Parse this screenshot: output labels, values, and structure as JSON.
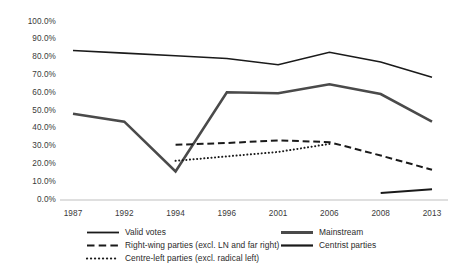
{
  "chart_data": {
    "type": "line",
    "title": "",
    "subtitle": "",
    "xlabel": "",
    "ylabel": "",
    "categories": [
      "1987",
      "1992",
      "1994",
      "1996",
      "2001",
      "2006",
      "2008",
      "2013"
    ],
    "ylim": [
      0,
      100
    ],
    "ytick_labels": [
      "0.0%",
      "10.0%",
      "20.0%",
      "30.0%",
      "40.0%",
      "50.0%",
      "60.0%",
      "70.0%",
      "80.0%",
      "90.0%",
      "100.0%"
    ],
    "ytick_values": [
      0,
      10,
      20,
      30,
      40,
      50,
      60,
      70,
      80,
      90,
      100
    ],
    "grid": false,
    "legend_position": "bottom",
    "series": [
      {
        "name": "Valid votes",
        "style": "solid",
        "color": "#1a1a1a",
        "width": 1.6,
        "values": [
          84.0,
          82.5,
          81.0,
          79.5,
          76.0,
          83.0,
          77.5,
          69.0
        ]
      },
      {
        "name": "Mainstream",
        "style": "solid",
        "color": "#4a4a4a",
        "width": 2.6,
        "values": [
          48.5,
          44.0,
          16.0,
          60.5,
          60.0,
          65.0,
          59.5,
          44.0
        ]
      },
      {
        "name": "Right-wing parties (excl. LN and far right)",
        "style": "dashed",
        "color": "#1a1a1a",
        "width": 2.0,
        "values": [
          null,
          null,
          31.0,
          32.0,
          33.5,
          32.5,
          25.0,
          17.0
        ]
      },
      {
        "name": "Centrist parties",
        "style": "solid",
        "color": "#1a1a1a",
        "width": 2.0,
        "values": [
          null,
          null,
          null,
          null,
          null,
          null,
          4.0,
          6.0
        ]
      },
      {
        "name": "Centre-left parties (excl. radical left)",
        "style": "dotted",
        "color": "#1a1a1a",
        "width": 2.0,
        "values": [
          null,
          null,
          22.0,
          24.5,
          27.0,
          31.5,
          null,
          null
        ]
      }
    ],
    "legend_entries": [
      {
        "label": "Valid votes",
        "style": "solid",
        "color": "#1a1a1a",
        "width": 1.8
      },
      {
        "label": "Mainstream",
        "style": "solid",
        "color": "#4a4a4a",
        "width": 3.0
      },
      {
        "label": "Right-wing parties (excl. LN and far right)",
        "style": "dashed",
        "color": "#1a1a1a",
        "width": 2.2
      },
      {
        "label": "Centrist parties",
        "style": "solid",
        "color": "#1a1a1a",
        "width": 2.2
      },
      {
        "label": "Centre-left parties (excl. radical left)",
        "style": "dotted",
        "color": "#1a1a1a",
        "width": 2.2
      }
    ],
    "axis_color": "#bfbfbf"
  }
}
